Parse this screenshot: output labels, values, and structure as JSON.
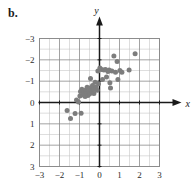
{
  "figure": {
    "part_label": "b.",
    "type": "scatter-plot"
  },
  "axes": {
    "x_name": "x",
    "y_name": "y",
    "x_ticks": [
      "-3",
      "-2",
      "-1",
      "0",
      "1",
      "2",
      "3"
    ],
    "y_ticks": [
      "3",
      "2",
      "1",
      "0",
      "-1",
      "-2",
      "-3"
    ],
    "grid": "on",
    "grid_color": "#8c8c8c",
    "minor_grid_color": "#c8c8c8",
    "axis_color": "#1a1a1a",
    "point_color": "#7d7d7d"
  },
  "chart_data": {
    "type": "scatter",
    "title": "",
    "xlabel": "x",
    "ylabel": "y",
    "xlim": [
      -3,
      3
    ],
    "ylim": [
      -3,
      3
    ],
    "xticks": [
      -3,
      -2,
      -1,
      0,
      1,
      2,
      3
    ],
    "yticks": [
      -3,
      -2,
      -1,
      0,
      1,
      2,
      3
    ],
    "grid": true,
    "legend": null,
    "marker": "circle",
    "marker_color": "#7d7d7d",
    "series": [
      {
        "name": "data",
        "points": [
          [
            -1.62,
            -0.38
          ],
          [
            -1.45,
            -0.75
          ],
          [
            -1.22,
            -0.52
          ],
          [
            -1.15,
            0.12
          ],
          [
            -1.05,
            0.02
          ],
          [
            -0.98,
            0.3
          ],
          [
            -0.95,
            0.52
          ],
          [
            -0.92,
            -0.5
          ],
          [
            -0.88,
            0.62
          ],
          [
            -0.82,
            0.35
          ],
          [
            -0.78,
            0.45
          ],
          [
            -0.72,
            0.28
          ],
          [
            -0.7,
            0.58
          ],
          [
            -0.65,
            0.42
          ],
          [
            -0.62,
            0.72
          ],
          [
            -0.58,
            0.33
          ],
          [
            -0.55,
            0.5
          ],
          [
            -0.5,
            0.4
          ],
          [
            -0.48,
            0.68
          ],
          [
            -0.45,
            1.12
          ],
          [
            -0.42,
            0.55
          ],
          [
            -0.38,
            0.48
          ],
          [
            -0.35,
            0.8
          ],
          [
            -0.3,
            0.62
          ],
          [
            -0.28,
            0.42
          ],
          [
            -0.22,
            0.95
          ],
          [
            -0.18,
            0.72
          ],
          [
            -0.12,
            0.58
          ],
          [
            -0.08,
            1.48
          ],
          [
            -0.05,
            0.88
          ],
          [
            0.02,
            1.62
          ],
          [
            0.1,
            1.55
          ],
          [
            0.15,
            1.08
          ],
          [
            0.22,
            1.52
          ],
          [
            0.3,
            1.55
          ],
          [
            0.35,
            1.2
          ],
          [
            0.42,
            1.45
          ],
          [
            0.48,
            1.52
          ],
          [
            0.52,
            0.92
          ],
          [
            0.55,
            0.68
          ],
          [
            0.62,
            1.48
          ],
          [
            0.72,
            2.18
          ],
          [
            0.8,
            1.42
          ],
          [
            0.88,
            1.92
          ],
          [
            0.92,
            1.08
          ],
          [
            1.02,
            1.5
          ],
          [
            1.12,
            1.42
          ],
          [
            1.48,
            1.52
          ],
          [
            1.78,
            2.28
          ]
        ]
      }
    ]
  }
}
